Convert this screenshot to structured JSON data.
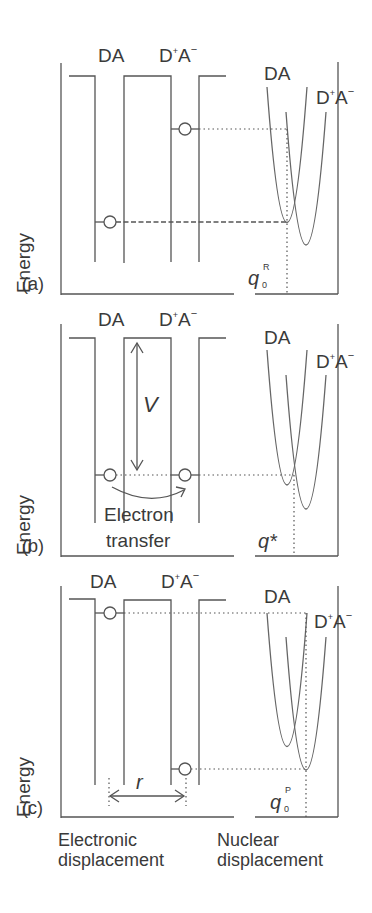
{
  "figure": {
    "y_axis_label": "Energy",
    "panels": [
      {
        "id": "a",
        "label": "(a)",
        "well_labels": {
          "left": "DA",
          "right_main": "D",
          "right_sup_plus": "+",
          "right_A": "A",
          "right_sup_minus": "−"
        },
        "curve_labels": {
          "reactant": "DA",
          "product_main": "D",
          "product_sup_plus": "+",
          "product_A": "A",
          "product_sup_minus": "−"
        },
        "coord_label": {
          "q": "q",
          "sub": "0",
          "sup": "R"
        }
      },
      {
        "id": "b",
        "label": "(b)",
        "well_labels": {
          "left": "DA",
          "right_main": "D",
          "right_sup_plus": "+",
          "right_A": "A",
          "right_sup_minus": "−"
        },
        "curve_labels": {
          "reactant": "DA",
          "product_main": "D",
          "product_sup_plus": "+",
          "product_A": "A",
          "product_sup_minus": "−"
        },
        "coupling_label": "V",
        "transfer_label_line1": "Electron",
        "transfer_label_line2": "transfer",
        "coord_label": {
          "q": "q*"
        }
      },
      {
        "id": "c",
        "label": "(c)",
        "well_labels": {
          "left": "DA",
          "right_main": "D",
          "right_sup_plus": "+",
          "right_A": "A",
          "right_sup_minus": "−"
        },
        "curve_labels": {
          "reactant": "DA",
          "product_main": "D",
          "product_sup_plus": "+",
          "product_A": "A",
          "product_sup_minus": "−"
        },
        "distance_label": "r",
        "coord_label": {
          "q": "q",
          "sub": "0",
          "sup": "P"
        }
      }
    ],
    "x_axis_labels": {
      "left_line1": "Electronic",
      "left_line2": "displacement",
      "right_line1": "Nuclear",
      "right_line2": "displacement"
    }
  }
}
